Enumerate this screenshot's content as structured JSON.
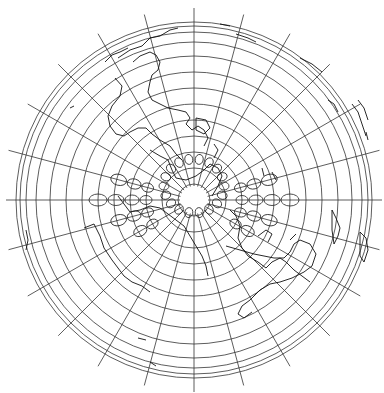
{
  "map": {
    "projection": "azimuthal",
    "center": [
      194,
      200
    ],
    "stroke_color": "#333333",
    "background": "#ffffff",
    "graticule": {
      "parallel_radii": [
        16,
        32,
        48,
        64,
        80,
        96,
        112,
        128,
        144,
        158,
        168,
        174,
        178
      ],
      "meridian_count": 24,
      "meridian_inner_radius": 14,
      "meridian_outer_radius": 192
    },
    "tissot": {
      "rings": [
        {
          "r": 48,
          "rx": 4.5,
          "ry": 6,
          "start": 150,
          "end": 390,
          "step": 15
        },
        {
          "r": 62,
          "rx": 5,
          "ry": 7,
          "start": 150,
          "end": 390,
          "step": 15
        },
        {
          "r": 78,
          "rx": 5.5,
          "ry": 8,
          "start": 165,
          "end": 375,
          "step": 15
        },
        {
          "r": 96,
          "rx": 6,
          "ry": 9,
          "start": 180,
          "end": 360,
          "step": 15
        },
        {
          "r": 114,
          "rx": 6.5,
          "ry": 10,
          "start": 195,
          "end": 345,
          "step": 15
        }
      ],
      "inner": {
        "r": 30,
        "rx": 4,
        "ry": 5,
        "start": 0,
        "end": 360,
        "step": 20
      }
    },
    "coastlines": [
      "M118,58 L130,50 L142,46 L150,38 L160,36 L170,30 L178,28",
      "M105,62 L112,55 L120,52 L128,48",
      "M133,62 L140,56 L150,52 L156,55 L160,62 L158,70 L152,75 L150,82 L148,92 L152,100 L160,104 L168,108 L178,110 L186,112 L190,118 L186,124 L192,130 L198,126 L204,130 L208,138 L204,146",
      "M115,78 L122,86 L120,96 L112,106 L108,116 L110,126 L116,134 L124,136 L130,132 L138,128 L146,128 L152,134 L160,140 L170,146 L176,154 L182,160",
      "M70,108 L74,106",
      "M196,118 L206,120 L210,128 L204,134 L196,130 Z",
      "M214,144 L218,150 L214,158",
      "M150,150 L160,156 L168,160 L172,170 L176,178 L186,180 L196,176 L204,170 L210,164 L218,168 L222,176 L218,186 L212,196",
      "M118,196 L124,204 L130,212 L140,210 L150,206 L160,208 L168,214 L176,220 L184,226 L190,236 L196,246 L202,256 L206,266 L208,276",
      "M84,228 L94,224 L100,236 L104,248 L112,260 L118,268 L124,276 L132,282 L142,286 L150,292",
      "M230,210 L236,216 L240,226 L238,238 L242,248 L248,256 L258,262 L266,268 L272,262 L280,258 L286,262 L294,270 L302,276 L310,282",
      "M226,246 L240,250 L254,254 L264,256 L274,258 L284,258 L290,252 L294,244 L300,240 L310,244 L316,254 L312,266 L304,272 L292,278 L280,282 L270,284 L260,290 L250,300 L242,306 L238,314 L244,318 L252,312",
      "M258,236 L266,230 L272,234 L268,242",
      "M290,240 L296,234",
      "M332,210 L336,218 L340,228 L338,236 L334,244 L332,230 Z",
      "M360,232 L366,238 L368,250 L364,262 L360,256 Z",
      "M328,100 L334,104 L338,112",
      "M352,104 L358,112 L362,124 L366,136",
      "M358,100 L364,108 L368,120",
      "M366,132 L368,140",
      "M236,34 L248,38 L256,42",
      "M220,24 L230,26",
      "M300,58 L312,64 L322,72",
      "M26,230 L28,240 L26,250",
      "M138,338 L146,340",
      "M150,362 L156,366",
      "M272,172 L276,180",
      "M262,168 L264,176"
    ]
  }
}
